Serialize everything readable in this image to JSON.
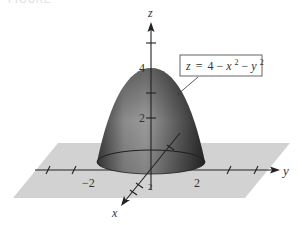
{
  "figure": {
    "header_text": "FIGURE",
    "equation_label": "z = 4 − x² − y²",
    "equation_parts": {
      "lhs": "z",
      "eq": "=",
      "const": "4",
      "minus1": "−",
      "x": "x",
      "sup1": "2",
      "minus2": "−",
      "y": "y",
      "sup2": "2"
    },
    "axes": {
      "x": {
        "label": "x",
        "tick_labels": [
          "2"
        ]
      },
      "y": {
        "label": "y",
        "tick_labels": [
          "−2",
          "2"
        ]
      },
      "z": {
        "label": "z",
        "tick_labels": [
          "4",
          "2"
        ]
      }
    },
    "surface": {
      "name": "paraboloid",
      "apex_z": 4,
      "base_radius": 2,
      "colors": {
        "light": "#b8b8b8",
        "mid": "#6e6e6e",
        "dark": "#2a2a2a"
      }
    },
    "plane_color": "#cfcfcf"
  }
}
